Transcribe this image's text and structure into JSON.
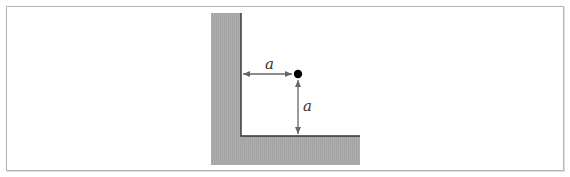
{
  "figure": {
    "labels": {
      "horizontal_distance": "a",
      "vertical_distance": "a"
    },
    "colors": {
      "wall_fill": "#aaaaaa",
      "wall_edge": "#333333",
      "arrow": "#666666",
      "point": "#000000",
      "frame_border": "#b5b5b5"
    }
  }
}
